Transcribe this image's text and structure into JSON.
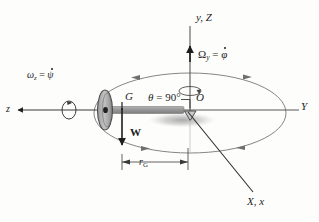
{
  "figure": {
    "type": "mechanics-diagram",
    "background_color": "#fdfdfc",
    "ink_color": "#1d1d1d",
    "shaft_color": "#8c8c8c",
    "rotor_color": "#a9a9a9",
    "orbit_color": "#7a7a7a",
    "shadow_color": "#bdbdbd"
  },
  "labels": {
    "vertical_axis": {
      "text": "y, Z",
      "glyph": "y, Z"
    },
    "precession_rate": {
      "symbol": "Ω",
      "subscript": "y",
      "equals": "=",
      "value_symbol": "φ",
      "value_dot": true,
      "text": "Ωy = φ̇"
    },
    "spin_rate": {
      "symbol": "ω",
      "subscript": "z",
      "equals": "=",
      "value_symbol": "ψ",
      "value_dot": true,
      "text": "ωz = ψ̇"
    },
    "spin_axis": {
      "text": "z"
    },
    "mass_center": {
      "text": "G"
    },
    "nutation_angle": {
      "symbol": "θ",
      "equals": "=",
      "value": "90",
      "unit": "°",
      "text": "θ = 90°"
    },
    "origin": {
      "text": "O"
    },
    "horizontal_axis": {
      "text": "Y"
    },
    "weight_vector": {
      "text": "W"
    },
    "radius_dimension": {
      "symbol": "r",
      "subscript": "G",
      "text": "rG"
    },
    "third_axis": {
      "text": "X, x"
    }
  },
  "elements": {
    "rotor_disk": "rotor-disk",
    "shaft": "shaft-bar",
    "pivot": "pivot-support",
    "shadow": "ground-shadow",
    "orbit_ellipse": "precession-orbit-ellipse",
    "spin_circle": "spin-direction-circle",
    "precession_circle": "precession-direction-circle",
    "dimension_line": "radius-dimension-line"
  }
}
